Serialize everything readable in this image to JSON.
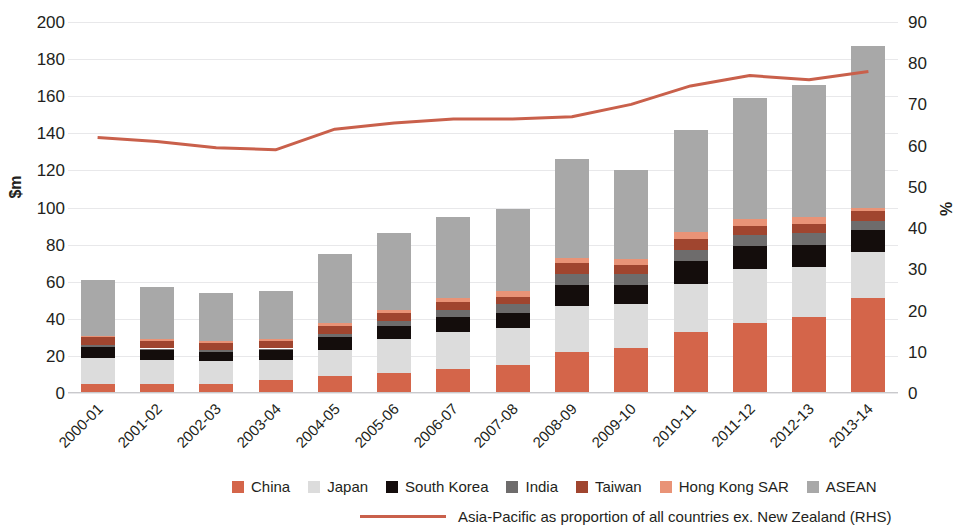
{
  "chart_data": {
    "type": "bar",
    "subtype": "stacked-bar-with-line",
    "title": "",
    "xlabel": "",
    "ylabel": "$m",
    "y2label": "%",
    "ylim": [
      0,
      200
    ],
    "y2lim": [
      0,
      90
    ],
    "y_ticks": [
      0,
      20,
      40,
      60,
      80,
      100,
      120,
      140,
      160,
      180,
      200
    ],
    "y2_ticks": [
      0,
      10,
      20,
      30,
      40,
      50,
      60,
      70,
      80,
      90
    ],
    "grid": true,
    "legend_position": "bottom",
    "categories": [
      "2000-01",
      "2001-02",
      "2002-03",
      "2003-04",
      "2004-05",
      "2005-06",
      "2006-07",
      "2007-08",
      "2008-09",
      "2009-10",
      "2010-11",
      "2011-12",
      "2012-13",
      "2013-14"
    ],
    "series": [
      {
        "name": "China",
        "color": "#d4654a",
        "values": [
          5,
          5,
          5,
          7,
          9,
          11,
          13,
          15,
          22,
          24,
          33,
          38,
          41,
          51
        ]
      },
      {
        "name": "Japan",
        "color": "#dcdcdc",
        "values": [
          14,
          13,
          12,
          11,
          14,
          18,
          20,
          20,
          25,
          24,
          26,
          29,
          27,
          25
        ]
      },
      {
        "name": "South Korea",
        "color": "#140d0c",
        "values": [
          6,
          5,
          5,
          5,
          7,
          7,
          8,
          8,
          11,
          10,
          12,
          12,
          12,
          12
        ]
      },
      {
        "name": "India",
        "color": "#6e6c6c",
        "values": [
          1,
          1,
          1,
          1,
          2,
          3,
          4,
          5,
          6,
          6,
          6,
          6,
          6,
          5
        ]
      },
      {
        "name": "Taiwan",
        "color": "#a0452f",
        "values": [
          4,
          4,
          4,
          4,
          4,
          4,
          4,
          4,
          6,
          5,
          6,
          5,
          5,
          5
        ]
      },
      {
        "name": "Hong Kong SAR",
        "color": "#e99377",
        "values": [
          1,
          1,
          1,
          1,
          2,
          2,
          2,
          3,
          3,
          3,
          4,
          4,
          4,
          2
        ]
      },
      {
        "name": "ASEAN",
        "color": "#a8a8a8",
        "values": [
          30,
          28,
          26,
          26,
          37,
          41,
          44,
          44,
          53,
          48,
          55,
          65,
          71,
          87
        ]
      }
    ],
    "totals": [
      61,
      57,
      54,
      55,
      75,
      86,
      95,
      99,
      126,
      120,
      142,
      159,
      166,
      187
    ],
    "line_series": {
      "name": "Asia-Pacific as proportion of all countries ex. New Zealand (RHS)",
      "color": "#c9604b",
      "axis": "right",
      "unit": "%",
      "values": [
        62,
        61,
        59.5,
        59,
        64,
        65.5,
        66.5,
        66.5,
        67,
        70,
        74.5,
        77,
        76,
        78
      ]
    }
  },
  "legend": {
    "items": [
      {
        "label": "China",
        "color": "#d4654a"
      },
      {
        "label": "Japan",
        "color": "#dcdcdc"
      },
      {
        "label": "South Korea",
        "color": "#140d0c"
      },
      {
        "label": "India",
        "color": "#6e6c6c"
      },
      {
        "label": "Taiwan",
        "color": "#a0452f"
      },
      {
        "label": "Hong Kong SAR",
        "color": "#e99377"
      },
      {
        "label": "ASEAN",
        "color": "#a8a8a8"
      }
    ],
    "line_label": "Asia-Pacific as proportion of all countries ex. New Zealand (RHS)",
    "line_color": "#c9604b"
  }
}
